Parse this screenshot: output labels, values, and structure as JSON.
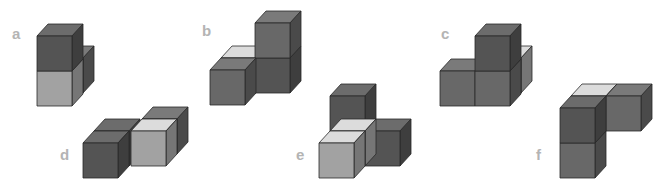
{
  "colors": {
    "dark_front": "#545454",
    "dark_top": "#6c6c6c",
    "dark_side": "#3e3e3e",
    "mid_front": "#686868",
    "mid_top": "#7a7a7a",
    "mid_side": "#4a4a4a",
    "light_front": "#a2a2a2",
    "light_top": "#dcdcdc",
    "light_side": "#767676",
    "label": "#b4b4b4"
  },
  "cube": {
    "size": 35,
    "dx": 11,
    "dy": -12
  },
  "figures": [
    {
      "label": "a",
      "label_pos": [
        12,
        25
      ],
      "cubes": [
        {
          "x": 48,
          "y": 58,
          "shade": "mid"
        },
        {
          "x": 37,
          "y": 71,
          "shade": "light"
        },
        {
          "x": 37,
          "y": 36,
          "shade": "dark"
        }
      ]
    },
    {
      "label": "b",
      "label_pos": [
        202,
        22
      ],
      "cubes": [
        {
          "x": 221,
          "y": 58,
          "shade": "light"
        },
        {
          "x": 255,
          "y": 58,
          "shade": "dark"
        },
        {
          "x": 255,
          "y": 23,
          "shade": "mid"
        },
        {
          "x": 210,
          "y": 70,
          "shade": "mid"
        }
      ]
    },
    {
      "label": "c",
      "label_pos": [
        441,
        25
      ],
      "cubes": [
        {
          "x": 486,
          "y": 58,
          "shade": "light"
        },
        {
          "x": 440,
          "y": 71,
          "shade": "mid"
        },
        {
          "x": 475,
          "y": 71,
          "shade": "mid"
        },
        {
          "x": 475,
          "y": 36,
          "shade": "dark"
        }
      ]
    },
    {
      "label": "d",
      "label_pos": [
        60,
        146
      ],
      "cubes": [
        {
          "x": 142,
          "y": 119,
          "shade": "mid"
        },
        {
          "x": 94,
          "y": 131,
          "shade": "dark"
        },
        {
          "x": 131,
          "y": 131,
          "shade": "light"
        },
        {
          "x": 83,
          "y": 143,
          "shade": "dark"
        }
      ]
    },
    {
      "label": "e",
      "label_pos": [
        296,
        146
      ],
      "cubes": [
        {
          "x": 330,
          "y": 96,
          "shade": "dark"
        },
        {
          "x": 365,
          "y": 131,
          "shade": "dark"
        },
        {
          "x": 330,
          "y": 131,
          "shade": "light"
        },
        {
          "x": 319,
          "y": 143,
          "shade": "light"
        }
      ]
    },
    {
      "label": "f",
      "label_pos": [
        536,
        146
      ],
      "cubes": [
        {
          "x": 571,
          "y": 96,
          "shade": "light"
        },
        {
          "x": 606,
          "y": 96,
          "shade": "mid"
        },
        {
          "x": 560,
          "y": 143,
          "shade": "mid"
        },
        {
          "x": 560,
          "y": 108,
          "shade": "dark"
        }
      ]
    }
  ]
}
